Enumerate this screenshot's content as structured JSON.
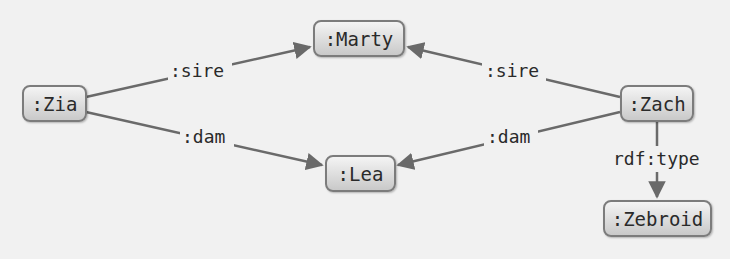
{
  "colors": {
    "background": "#f1f1f1",
    "edge": "#6a6a6a",
    "node_border": "#7c7c7c",
    "node_fill_top": "#f4f4f4",
    "node_fill_bottom": "#c9c9c9",
    "text": "#2a2a2a"
  },
  "nodes": {
    "marty": ":Marty",
    "zia": ":Zia",
    "zach": ":Zach",
    "lea": ":Lea",
    "zebroid": ":Zebroid"
  },
  "edges": [
    {
      "from": "zia",
      "to": "marty",
      "label": ":sire"
    },
    {
      "from": "zach",
      "to": "marty",
      "label": ":sire"
    },
    {
      "from": "zia",
      "to": "lea",
      "label": ":dam"
    },
    {
      "from": "zach",
      "to": "lea",
      "label": ":dam"
    },
    {
      "from": "zach",
      "to": "zebroid",
      "label": "rdf:type"
    }
  ]
}
